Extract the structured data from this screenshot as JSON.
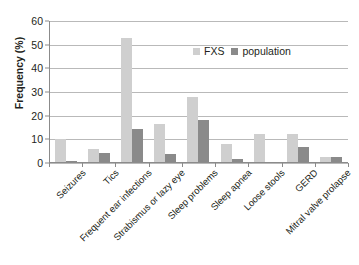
{
  "chart_data": {
    "type": "bar",
    "title": "",
    "xlabel": "",
    "ylabel": "Frequency (%)",
    "ylim": [
      0,
      60
    ],
    "yticks": [
      0,
      10,
      20,
      30,
      40,
      50,
      60
    ],
    "grid": true,
    "legend_position": "top-right",
    "categories": [
      "Seizures",
      "Tics",
      "Frequent ear infections",
      "Strabismus or lazy eye",
      "Sleep problems",
      "Sleep apnea",
      "Loose stools",
      "GERD",
      "Mitral valve prolapse"
    ],
    "series": [
      {
        "name": "FXS",
        "color": "#cfcfcf",
        "values": [
          10.0,
          6.0,
          53.0,
          16.5,
          27.8,
          8.0,
          12.2,
          12.4,
          2.5
        ]
      },
      {
        "name": "population",
        "color": "#8a8a8a",
        "values": [
          1.0,
          4.2,
          14.4,
          3.6,
          18.0,
          1.8,
          0.0,
          6.6,
          2.5
        ]
      }
    ]
  },
  "legend": {
    "items": [
      {
        "label": "FXS",
        "swatch": "legend-swatch-fxs"
      },
      {
        "label": "population",
        "swatch": "legend-swatch-population"
      }
    ]
  },
  "axes": {
    "y_title": "Frequency (%)"
  }
}
